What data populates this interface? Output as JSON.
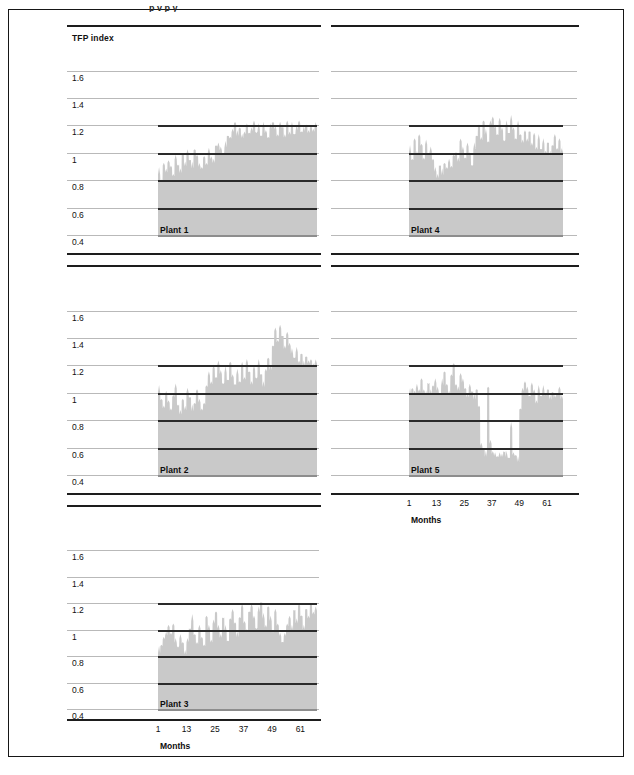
{
  "figure": {
    "y_axis_title": "TFP index",
    "x_axis_title": "Months",
    "y_ticks": [
      "1.6",
      "1.4",
      "1.2",
      "1",
      "0.8",
      "0.6",
      "0.4"
    ],
    "x_ticks": [
      "1",
      "13",
      "25",
      "37",
      "49",
      "61"
    ],
    "series_fill_color": "#c9c9c9",
    "gridline_color": "#b9b9b9",
    "refline_color": "#2a2a2a",
    "rule_color": "#1d1d1d",
    "clipped_header_text": "p    v        p  y"
  },
  "chart_data": {
    "type": "area",
    "title": "",
    "xlabel": "Months",
    "ylabel": "TFP index",
    "ylim": [
      0.4,
      1.7
    ],
    "xlim": [
      1,
      68
    ],
    "yticks": [
      1.6,
      1.4,
      1.2,
      1.0,
      0.8,
      0.6,
      0.4
    ],
    "xticks": [
      1,
      13,
      25,
      37,
      49,
      61
    ],
    "grid": true,
    "legend": "none",
    "panel_layout": "2 columns x 3 rows; Plant 1 / Plant 2 / Plant 3 left column, Plant 4 / Plant 5 right column",
    "reference_levels": [
      1.2,
      1.0,
      0.8,
      0.6
    ],
    "panels": [
      {
        "name": "Plant 1",
        "y_axis_labeled": true,
        "x_axis_labeled": false,
        "values": [
          0.86,
          0.8,
          0.9,
          0.87,
          0.93,
          0.88,
          0.84,
          0.95,
          0.9,
          0.86,
          0.98,
          0.92,
          1.0,
          0.94,
          0.9,
          1.02,
          0.96,
          0.91,
          0.88,
          0.95,
          0.92,
          1.0,
          0.97,
          0.93,
          1.04,
          1.06,
          1.02,
          0.99,
          1.05,
          1.12,
          1.09,
          1.16,
          1.21,
          1.14,
          1.18,
          1.1,
          1.15,
          1.19,
          1.13,
          1.17,
          1.21,
          1.14,
          1.18,
          1.12,
          1.2,
          1.15,
          1.1,
          1.19,
          1.22,
          1.16,
          1.13,
          1.2,
          1.17,
          1.12,
          1.21,
          1.15,
          1.19,
          1.13,
          1.18,
          1.22,
          1.14,
          1.17,
          1.2,
          1.13,
          1.19,
          1.15,
          1.21,
          1.18
        ]
      },
      {
        "name": "Plant 2",
        "y_axis_labeled": true,
        "x_axis_labeled": false,
        "values": [
          1.02,
          0.95,
          0.88,
          1.0,
          0.93,
          0.86,
          0.98,
          1.03,
          0.9,
          0.85,
          0.94,
          0.89,
          1.01,
          0.96,
          0.88,
          0.92,
          1.0,
          0.94,
          0.87,
          0.9,
          1.05,
          1.12,
          1.08,
          1.18,
          1.1,
          1.22,
          1.14,
          1.06,
          1.16,
          1.09,
          1.2,
          1.12,
          1.05,
          1.15,
          1.08,
          1.19,
          1.11,
          1.22,
          1.14,
          1.07,
          1.17,
          1.1,
          1.21,
          1.13,
          1.06,
          1.16,
          1.24,
          1.18,
          1.34,
          1.44,
          1.38,
          1.47,
          1.4,
          1.33,
          1.42,
          1.36,
          1.29,
          1.25,
          1.31,
          1.22,
          1.27,
          1.21,
          1.26,
          1.2,
          1.24,
          1.19,
          1.23,
          1.25
        ]
      },
      {
        "name": "Plant 3",
        "y_axis_labeled": true,
        "x_axis_labeled": true,
        "values": [
          0.84,
          0.88,
          0.92,
          0.97,
          1.02,
          0.95,
          1.04,
          0.9,
          0.86,
          0.94,
          0.89,
          0.83,
          0.91,
          1.0,
          1.08,
          0.96,
          0.88,
          1.02,
          0.93,
          0.86,
          1.1,
          1.0,
          0.92,
          1.05,
          1.12,
          1.02,
          0.94,
          1.08,
          1.0,
          0.91,
          1.06,
          1.14,
          1.04,
          0.96,
          1.09,
          1.16,
          1.06,
          0.98,
          1.12,
          1.18,
          1.08,
          1.0,
          1.14,
          1.2,
          1.1,
          1.02,
          1.16,
          1.08,
          0.98,
          1.12,
          1.04,
          0.95,
          0.89,
          0.96,
          1.02,
          1.1,
          1.0,
          1.14,
          1.06,
          1.18,
          1.09,
          1.01,
          1.15,
          1.07,
          1.19,
          1.11,
          1.16,
          1.2
        ]
      },
      {
        "name": "Plant 4",
        "y_axis_labeled": false,
        "x_axis_labeled": false,
        "values": [
          1.02,
          0.95,
          1.08,
          1.0,
          1.12,
          1.04,
          0.96,
          1.06,
          0.98,
          1.02,
          0.94,
          0.88,
          0.82,
          0.9,
          0.85,
          0.92,
          0.87,
          0.94,
          0.89,
          0.96,
          1.0,
          0.93,
          1.1,
          1.02,
          0.95,
          1.06,
          0.98,
          0.9,
          1.04,
          1.12,
          1.18,
          1.1,
          1.22,
          1.15,
          1.08,
          1.2,
          1.26,
          1.18,
          1.12,
          1.24,
          1.16,
          1.08,
          1.2,
          1.14,
          1.25,
          1.17,
          1.09,
          1.21,
          1.13,
          1.06,
          1.16,
          1.08,
          1.14,
          1.06,
          1.12,
          1.04,
          1.1,
          1.02,
          1.08,
          1.0,
          1.06,
          0.99,
          1.05,
          1.1,
          1.03,
          1.08,
          1.02,
          1.07
        ]
      },
      {
        "name": "Plant 5",
        "y_axis_labeled": false,
        "x_axis_labeled": true,
        "values": [
          1.0,
          1.03,
          0.99,
          1.05,
          1.01,
          1.08,
          1.02,
          0.98,
          1.06,
          1.0,
          1.04,
          1.09,
          1.02,
          0.99,
          1.07,
          1.15,
          1.04,
          1.0,
          1.12,
          1.19,
          1.06,
          1.01,
          1.14,
          1.08,
          1.02,
          0.98,
          1.04,
          1.0,
          0.96,
          1.02,
          0.88,
          0.62,
          0.58,
          0.55,
          1.04,
          0.62,
          0.57,
          0.54,
          0.52,
          0.55,
          0.53,
          0.56,
          0.54,
          0.52,
          0.76,
          0.55,
          0.53,
          0.51,
          0.88,
          1.0,
          1.08,
          1.02,
          0.96,
          1.06,
          1.0,
          0.94,
          1.02,
          0.97,
          1.03,
          0.98,
          1.01,
          0.96,
          1.0,
          0.95,
          0.99,
          1.02,
          0.97,
          1.0
        ]
      }
    ]
  }
}
